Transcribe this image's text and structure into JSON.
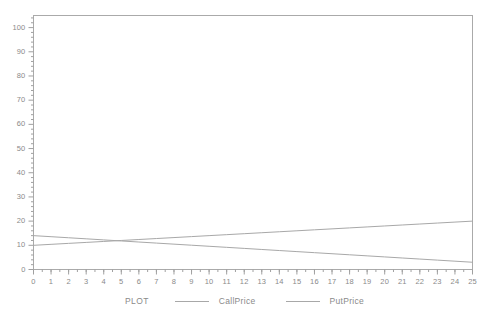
{
  "chart_data": {
    "type": "line",
    "title": "",
    "subtitle": "",
    "xlabel": "",
    "ylabel": "",
    "xlim": [
      0,
      25
    ],
    "ylim": [
      0,
      105
    ],
    "grid": false,
    "legend_position": "bottom",
    "legend_title": "PLOT",
    "x_tick_labels": [
      "0",
      "1",
      "2",
      "3",
      "4",
      "5",
      "6",
      "7",
      "8",
      "9",
      "10",
      "11",
      "12",
      "13",
      "14",
      "15",
      "16",
      "17",
      "18",
      "19",
      "20",
      "21",
      "22",
      "23",
      "24",
      "25"
    ],
    "y_tick_labels": [
      "0",
      "10",
      "20",
      "30",
      "40",
      "50",
      "60",
      "70",
      "80",
      "90",
      "100"
    ],
    "x_ticks": [
      0,
      1,
      2,
      3,
      4,
      5,
      6,
      7,
      8,
      9,
      10,
      11,
      12,
      13,
      14,
      15,
      16,
      17,
      18,
      19,
      20,
      21,
      22,
      23,
      24,
      25
    ],
    "y_ticks": [
      0,
      10,
      20,
      30,
      40,
      50,
      60,
      70,
      80,
      90,
      100
    ],
    "x": [
      0,
      1,
      2,
      3,
      4,
      5,
      6,
      7,
      8,
      9,
      10,
      11,
      12,
      13,
      14,
      15,
      16,
      17,
      18,
      19,
      20,
      21,
      22,
      23,
      24,
      25
    ],
    "series": [
      {
        "name": "CallPrice",
        "color": "#a8a8a8",
        "values": [
          10.0,
          10.4,
          10.8,
          11.2,
          11.6,
          12.0,
          12.4,
          12.8,
          13.2,
          13.6,
          14.0,
          14.4,
          14.8,
          15.2,
          15.6,
          16.0,
          16.4,
          16.8,
          17.2,
          17.6,
          18.0,
          18.4,
          18.8,
          19.2,
          19.6,
          20.0
        ]
      },
      {
        "name": "PutPrice",
        "color": "#a8a8a8",
        "values": [
          14.0,
          13.56,
          13.12,
          12.68,
          12.24,
          11.8,
          11.36,
          10.92,
          10.48,
          10.04,
          9.6,
          9.16,
          8.72,
          8.28,
          7.84,
          7.4,
          6.96,
          6.52,
          6.08,
          5.64,
          5.2,
          4.76,
          4.32,
          3.88,
          3.44,
          3.0
        ]
      }
    ],
    "annotations": []
  },
  "legend": {
    "title": "PLOT",
    "entries": [
      {
        "label": "CallPrice"
      },
      {
        "label": "PutPrice"
      }
    ]
  },
  "axes": {
    "frame_color": "#aaaaaa",
    "tick_color": "#a0a0a0",
    "label_color": "#8a8a8a"
  }
}
